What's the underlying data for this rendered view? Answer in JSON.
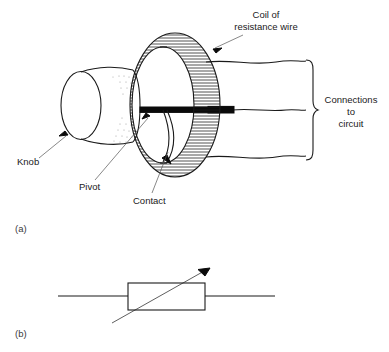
{
  "figure": {
    "title_visible": false,
    "background_color": "#ffffff",
    "ink_color": "#1a1a1a",
    "panels": [
      {
        "id": "a",
        "caption": "(a)",
        "description": "cutaway pictorial of a rotary variable resistor"
      },
      {
        "id": "b",
        "caption": "(b)",
        "description": "circuit symbol for a variable resistor"
      }
    ]
  },
  "labels": {
    "coil": {
      "line1": "Coil of",
      "line2": "resistance wire"
    },
    "connections": {
      "line1": "Connections",
      "line2": "to",
      "line3": "circuit"
    },
    "knob": "Knob",
    "pivot": "Pivot",
    "contact": "Contact",
    "caption_a": "(a)",
    "caption_b": "(b)"
  },
  "parts": {
    "knob": "cylinder-knob",
    "shaft": "central-shaft",
    "coil_ring": "toroidal-coil",
    "contact_arm": "wiper-contact-arm",
    "lead_wires": [
      "top-lead",
      "middle-lead",
      "bottom-lead"
    ],
    "brace": "right-curly-brace",
    "symbol_body": "resistor-rectangle",
    "symbol_arrow": "variable-arrow",
    "symbol_leads": [
      "left-lead",
      "right-lead"
    ]
  },
  "colors": {
    "ink": "#1a1a1a",
    "leader": "#555555",
    "background": "#ffffff",
    "solid_black": "#0a0a0a"
  }
}
